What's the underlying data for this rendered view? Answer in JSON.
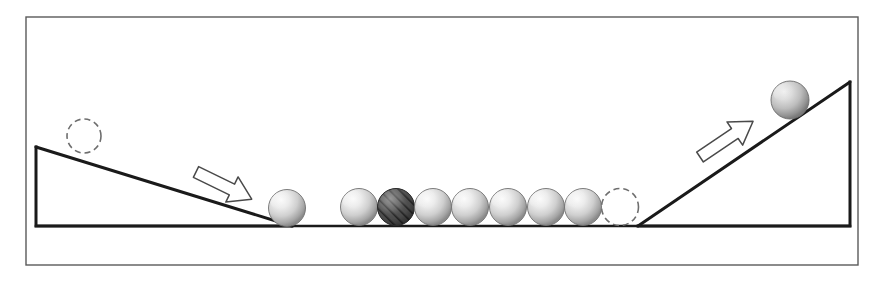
{
  "figure": {
    "canvas": {
      "width": 884,
      "height": 281
    },
    "background_color": "#ffffff"
  },
  "frame": {
    "name": "outer-border",
    "x": 26,
    "y": 17,
    "width": 832,
    "height": 248,
    "stroke_color": "#5a5a5a",
    "stroke_width": 1.4,
    "fill": "none"
  },
  "ground": {
    "name": "ground-line",
    "x1": 36,
    "y1": 226,
    "x2": 850,
    "y2": 226,
    "stroke_color": "#1a1a1a",
    "stroke_width": 2.6
  },
  "ramps": [
    {
      "id": "left-ramp",
      "label": "Left descending ramp",
      "points": "36,147 36,226 292,226",
      "slope_from": {
        "x": 36,
        "y": 147
      },
      "slope_to": {
        "x": 292,
        "y": 226
      },
      "stroke_color": "#1a1a1a",
      "stroke_width": 3.0,
      "fill": "none"
    },
    {
      "id": "right-ramp",
      "label": "Right ascending ramp",
      "points": "638,226 850,82 850,226",
      "slope_from": {
        "x": 638,
        "y": 226
      },
      "slope_to": {
        "x": 850,
        "y": 82
      },
      "stroke_color": "#1a1a1a",
      "stroke_width": 3.0,
      "fill": "none"
    }
  ],
  "ghost_balls": [
    {
      "id": "ghost-ball-left-top",
      "label": "Initial position of incoming ball on left ramp",
      "cx": 84,
      "cy": 136,
      "r": 17,
      "stroke_color": "#6e6e6e",
      "stroke_width": 1.6,
      "dash": "6 4"
    },
    {
      "id": "ghost-ball-right-end",
      "label": "Vacated position at right end of row",
      "cx": 620,
      "cy": 207,
      "r": 18.5,
      "stroke_color": "#6e6e6e",
      "stroke_width": 1.6,
      "dash": "6 4"
    }
  ],
  "solid_balls": [
    {
      "id": "ball-incoming-left",
      "label": "Incoming ball at foot of left ramp",
      "cx": 287,
      "cy": 208,
      "r": 18.5,
      "style": "plain",
      "fill_light": "#f2f2f2",
      "fill_mid": "#c9c9c9",
      "fill_dark": "#8e8e8e"
    },
    {
      "id": "ball-row-1",
      "label": "Row ball 1",
      "cx": 359,
      "cy": 207,
      "r": 18.5,
      "style": "plain",
      "fill_light": "#f2f2f2",
      "fill_mid": "#c9c9c9",
      "fill_dark": "#8e8e8e"
    },
    {
      "id": "ball-row-2-hatched",
      "label": "Row ball 2 (marked / hatched)",
      "cx": 396,
      "cy": 207,
      "r": 18.5,
      "style": "hatched",
      "fill_light": "#8a8a8a",
      "fill_mid": "#585858",
      "fill_dark": "#3a3a3a"
    },
    {
      "id": "ball-row-3",
      "label": "Row ball 3",
      "cx": 433,
      "cy": 207,
      "r": 18.5,
      "style": "plain",
      "fill_light": "#f2f2f2",
      "fill_mid": "#c9c9c9",
      "fill_dark": "#8e8e8e"
    },
    {
      "id": "ball-row-4",
      "label": "Row ball 4",
      "cx": 470,
      "cy": 207,
      "r": 18.5,
      "style": "plain",
      "fill_light": "#f2f2f2",
      "fill_mid": "#c9c9c9",
      "fill_dark": "#8e8e8e"
    },
    {
      "id": "ball-row-5",
      "label": "Row ball 5",
      "cx": 508,
      "cy": 207,
      "r": 18.5,
      "style": "plain",
      "fill_light": "#f2f2f2",
      "fill_mid": "#c9c9c9",
      "fill_dark": "#8e8e8e"
    },
    {
      "id": "ball-row-6",
      "label": "Row ball 6",
      "cx": 546,
      "cy": 207,
      "r": 18.5,
      "style": "plain",
      "fill_light": "#f2f2f2",
      "fill_mid": "#c9c9c9",
      "fill_dark": "#8e8e8e"
    },
    {
      "id": "ball-row-7",
      "label": "Row ball 7",
      "cx": 583,
      "cy": 207,
      "r": 18.5,
      "style": "plain",
      "fill_light": "#f2f2f2",
      "fill_mid": "#c9c9c9",
      "fill_dark": "#8e8e8e"
    },
    {
      "id": "ball-outgoing-right",
      "label": "Ejected ball travelling up right ramp",
      "cx": 790,
      "cy": 100,
      "r": 19,
      "style": "plain",
      "fill_light": "#e8e8e8",
      "fill_mid": "#b8b8b8",
      "fill_dark": "#7c7c7c"
    }
  ],
  "arrows": [
    {
      "id": "arrow-left-down",
      "label": "Motion arrow: ball rolling down left ramp",
      "direction": "down-right",
      "origin": {
        "x": 196,
        "y": 172
      },
      "angle_deg": 26,
      "length": 62,
      "stroke_color": "#4a4a4a",
      "stroke_width": 1.5,
      "fill": "#ffffff"
    },
    {
      "id": "arrow-right-up",
      "label": "Motion arrow: ball rolling up right ramp",
      "direction": "up-right",
      "origin": {
        "x": 700,
        "y": 157
      },
      "angle_deg": -34,
      "length": 64,
      "stroke_color": "#4a4a4a",
      "stroke_width": 1.5,
      "fill": "#ffffff"
    }
  ]
}
